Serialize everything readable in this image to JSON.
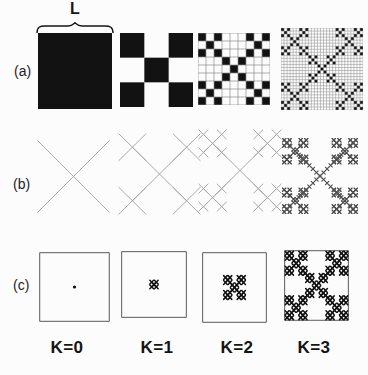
{
  "page": {
    "background": "#fcfcfc"
  },
  "annotation": {
    "length_label": "L"
  },
  "row_labels": [
    {
      "text": "(a)"
    },
    {
      "text": "(b)"
    },
    {
      "text": "(c)"
    }
  ],
  "iteration_labels": [
    {
      "text": "K=0"
    },
    {
      "text": "K=1"
    },
    {
      "text": "K=2"
    },
    {
      "text": "K=3"
    }
  ],
  "diagram": {
    "type": "fractal-iteration-figure",
    "generator": {
      "grid": 3,
      "cells": [
        [
          0,
          0
        ],
        [
          2,
          0
        ],
        [
          1,
          1
        ],
        [
          0,
          2
        ],
        [
          2,
          2
        ]
      ]
    },
    "rows": [
      {
        "id": "a",
        "style": "filled-cells",
        "levels": [
          0,
          1,
          2,
          3
        ],
        "grid_lines_from_level": 2
      },
      {
        "id": "b",
        "style": "diagonal-cross-lines",
        "levels": [
          0,
          1,
          2,
          3
        ],
        "bold_level": 3
      },
      {
        "id": "c",
        "style": "cluster-in-outlined-square",
        "levels": [
          0,
          1,
          2,
          3
        ]
      }
    ],
    "colors": {
      "ink": "#121212",
      "grid_line": "#8d8d8d",
      "thin_line": "#a9a9a9",
      "bold_line": "#4f4f4f",
      "outline": "#5a5a5a",
      "text": "#141414"
    }
  }
}
